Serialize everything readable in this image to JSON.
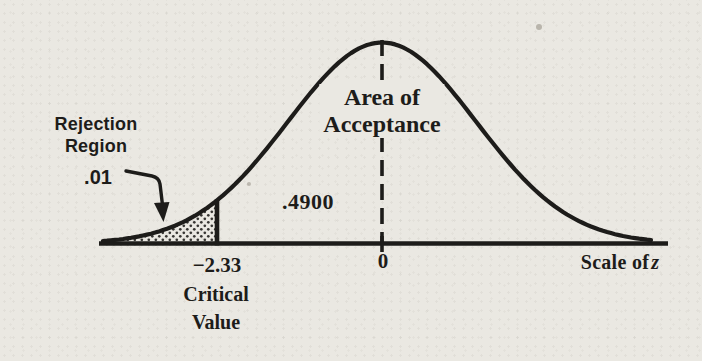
{
  "figure": {
    "labels": {
      "rejection_region": [
        "Rejection",
        "Region"
      ],
      "alpha": ".01",
      "acceptance": [
        "Area of",
        "Acceptance"
      ],
      "area_value": ".4900",
      "zero": "0",
      "critical_value": "−2.33",
      "critical_caption": [
        "Critical",
        "Value"
      ],
      "axis_label_text": "Scale of",
      "axis_label_var": "z"
    },
    "colors": {
      "ink": "#1d1c1a",
      "paper": "#eae8e2"
    }
  },
  "chart_data": {
    "type": "area",
    "curve": "standard normal density",
    "title": "",
    "xlabel": "Scale of z",
    "x_axis": {
      "ticks": [
        -2.33,
        0
      ],
      "tick_labels": [
        "−2.33",
        "0"
      ],
      "range": [
        -3.95,
        3.8
      ]
    },
    "center_line": {
      "z": 0,
      "style": "dashed"
    },
    "critical_value": {
      "z": -2.33,
      "caption": "Critical Value"
    },
    "regions": [
      {
        "name": "Rejection Region",
        "side": "left tail",
        "z_min": -3.95,
        "z_max": -2.33,
        "area": 0.01,
        "shaded": true
      },
      {
        "name": "Area of Acceptance",
        "z_min": -2.33,
        "z_max": 0,
        "area": 0.49,
        "shaded": false
      }
    ],
    "annotations": [
      "Rejection Region",
      ".01",
      "Area of Acceptance",
      ".4900",
      "Critical Value",
      "Scale of z"
    ]
  }
}
